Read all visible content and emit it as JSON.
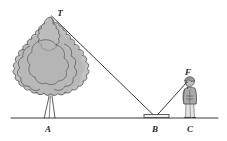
{
  "figure": {
    "kind": "geometry-diagram",
    "background_color": "#ffffff",
    "line_color": "#3a3a3a",
    "ground_color": "#3a3a3a"
  },
  "labels": {
    "tree_top": "T",
    "tree_base": "A",
    "mirror": "B",
    "eye": "F",
    "person_base": "C"
  },
  "points": {
    "T": {
      "x": 51,
      "y": 15
    },
    "A": {
      "x": 51,
      "y": 118
    },
    "B": {
      "x": 156,
      "y": 118
    },
    "F": {
      "x": 188,
      "y": 81
    },
    "C": {
      "x": 190,
      "y": 118
    }
  },
  "label_positions": {
    "T": {
      "x": 60,
      "y": 13
    },
    "A": {
      "x": 48,
      "y": 131
    },
    "B": {
      "x": 154,
      "y": 131
    },
    "F": {
      "x": 188,
      "y": 74
    },
    "C": {
      "x": 189,
      "y": 131
    }
  },
  "ground": {
    "name": "ground-line",
    "x1": 11,
    "x2": 218,
    "y": 118
  },
  "sight_lines": [
    {
      "name": "incident-ray-tree-to-mirror",
      "from": "T",
      "to": "B"
    },
    {
      "name": "reflected-ray-mirror-to-eye",
      "from": "B",
      "to": "F"
    }
  ],
  "mirror": {
    "name": "mirror-strip",
    "x": 144,
    "y": 115,
    "width": 25,
    "height": 3,
    "fill": "#f2f2f2",
    "stroke": "#3a3a3a"
  },
  "tree": {
    "name": "tree",
    "crown_fill": "#b6b6b6",
    "crown_fill_light": "#c9c9c9",
    "crown_stroke": "#4a4a4a",
    "trunk_stroke": "#4a4a4a",
    "crown_center": {
      "x": 50,
      "y": 62
    },
    "crown_width": 72,
    "crown_height": 92,
    "trunk_top": {
      "x": 50,
      "y": 95
    },
    "trunk_base": {
      "x": 51,
      "y": 118
    }
  },
  "person": {
    "name": "observer",
    "body_fill": "#a9a9a9",
    "body_stroke": "#4a4a4a",
    "head_fill": "#bdbdbd",
    "eye_point": {
      "x": 188,
      "y": 81
    },
    "feet": {
      "x": 190,
      "y": 118
    },
    "height_px": 40
  },
  "colors": {
    "ink": "#3a3a3a",
    "ink_dark": "#2b2b2b",
    "gray_mid": "#b6b6b6",
    "gray_light": "#c9c9c9",
    "gray_dark": "#a9a9a9",
    "white": "#ffffff"
  }
}
